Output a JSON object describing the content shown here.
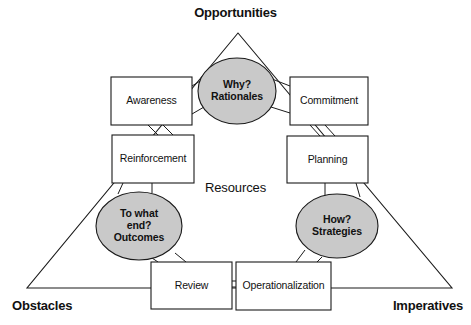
{
  "figure": {
    "background_color": "#ffffff",
    "line_color": "#1a1a1a",
    "box_fill": "#ffffff",
    "ellipse_fill": "#c9c9c9",
    "text_color": "#111111"
  },
  "corner_labels": [
    {
      "id": "opportunities",
      "text": "Opportunities",
      "position": "top"
    },
    {
      "id": "obstacles",
      "text": "Obstacles",
      "position": "bottom-left"
    },
    {
      "id": "imperatives",
      "text": "Imperatives",
      "position": "bottom-right"
    }
  ],
  "center_label": {
    "id": "resources",
    "text": "Resources"
  },
  "ellipses": [
    {
      "id": "rationales",
      "text": "Why?\nRationales",
      "position": "top"
    },
    {
      "id": "outcomes",
      "text": "To what\nend?\nOutcomes",
      "position": "bottom-left"
    },
    {
      "id": "strategies",
      "text": "How?\nStrategies",
      "position": "bottom-right"
    }
  ],
  "boxes": [
    {
      "id": "awareness",
      "text": "Awareness"
    },
    {
      "id": "commitment",
      "text": "Commitment"
    },
    {
      "id": "reinforcement",
      "text": "Reinforcement"
    },
    {
      "id": "planning",
      "text": "Planning"
    },
    {
      "id": "review",
      "text": "Review"
    },
    {
      "id": "operationalization",
      "text": "Operationalization"
    }
  ],
  "triangle": {
    "apex": [
      238,
      33
    ],
    "left_vertex": [
      27,
      288
    ],
    "right_vertex": [
      452,
      288
    ]
  }
}
